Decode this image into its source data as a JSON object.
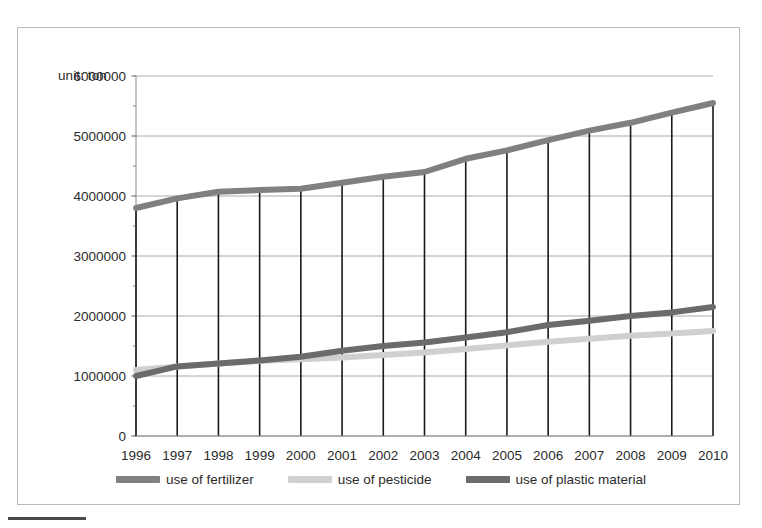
{
  "unit_label": "unit: ton",
  "colors": {
    "fertilizer": "#808080",
    "pesticide": "#d0d0d0",
    "plastic": "#6b6b6b",
    "droplines": "#1a1a1a",
    "gridlines": "#aaaaaa",
    "axis": "#888888",
    "text": "#2b2b2b",
    "frame": "#b9b9b9"
  },
  "legend": {
    "items": [
      {
        "label": "use of fertilizer",
        "color": "#808080"
      },
      {
        "label": "use of pesticide",
        "color": "#d0d0d0"
      },
      {
        "label": "use of plastic material",
        "color": "#6b6b6b"
      }
    ]
  },
  "chart_data": {
    "type": "line",
    "title": "",
    "subtitle": "",
    "xlabel": "",
    "ylabel": "unit: ton",
    "grid": true,
    "legend_position": "bottom",
    "categories": [
      "1996",
      "1997",
      "1998",
      "1999",
      "2000",
      "2001",
      "2002",
      "2003",
      "2004",
      "2005",
      "2006",
      "2007",
      "2008",
      "2009",
      "2010"
    ],
    "ylim": [
      0,
      6000000
    ],
    "yticks": [
      0,
      1000000,
      2000000,
      3000000,
      4000000,
      5000000,
      6000000
    ],
    "ytick_labels": [
      "0",
      "1000000",
      "2000000",
      "3000000",
      "4000000",
      "5000000",
      "6000000"
    ],
    "series": [
      {
        "name": "use of fertilizer",
        "color": "#808080",
        "values": [
          3800000,
          3960000,
          4070000,
          4100000,
          4120000,
          4220000,
          4320000,
          4400000,
          4620000,
          4760000,
          4930000,
          5090000,
          5220000,
          5390000,
          5550000
        ]
      },
      {
        "name": "use of pesticide",
        "color": "#d0d0d0",
        "values": [
          1100000,
          1160000,
          1210000,
          1250000,
          1280000,
          1310000,
          1350000,
          1390000,
          1450000,
          1510000,
          1570000,
          1620000,
          1670000,
          1710000,
          1750000
        ]
      },
      {
        "name": "use of plastic material",
        "color": "#6b6b6b",
        "values": [
          1000000,
          1160000,
          1210000,
          1260000,
          1320000,
          1420000,
          1500000,
          1560000,
          1640000,
          1730000,
          1850000,
          1920000,
          2000000,
          2060000,
          2150000
        ]
      }
    ]
  }
}
